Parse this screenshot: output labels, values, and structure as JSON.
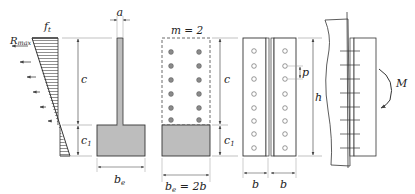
{
  "figure": {
    "stress_diagram": {
      "label_top": "f",
      "label_top_sub": "t",
      "label_force": "R",
      "label_force_sub": "max"
    },
    "dimensions": {
      "c": "c",
      "c1": "c",
      "c1_sub": "1",
      "a": "a",
      "be": "b",
      "be_sub": "e",
      "be2b_prefix": "b",
      "be2b_sub": "e",
      "be2b_suffix": " = 2b",
      "m_label": "m = 2",
      "p": "p",
      "h": "h",
      "b_left": "b",
      "b_right": "b",
      "moment": "M"
    },
    "colors": {
      "line": "#333333",
      "fill_gray": "#bdbdbd",
      "hole": "#8a8a8a",
      "dim": "#555555"
    },
    "bolt_rows": 8,
    "two_column_bolt_rows": 6
  }
}
